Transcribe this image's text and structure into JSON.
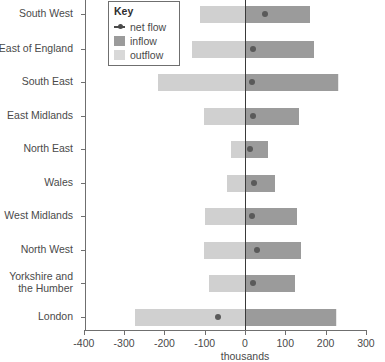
{
  "chart_data": {
    "type": "bar",
    "title": "",
    "subtitle": "",
    "xlabel": "thousands",
    "ylabel": "",
    "xlim": [
      -400,
      300
    ],
    "xticks": [
      -400,
      -300,
      -200,
      -100,
      0,
      100,
      200,
      300
    ],
    "xticklabels": [
      "-400",
      "-300",
      "-200",
      "-100",
      "0",
      "100",
      "200",
      "300"
    ],
    "grid": false,
    "orientation": "horizontal",
    "zero_reference_line": true,
    "units": "thousands",
    "categories": [
      "South West",
      "East of England",
      "South East",
      "East Midlands",
      "North East",
      "Wales",
      "West Midlands",
      "North West",
      "Yorkshire and the Humber",
      "London"
    ],
    "series": [
      {
        "name": "outflow",
        "color": "#d0d0d0",
        "values": [
          -112,
          -132,
          -217,
          -102,
          -35,
          -45,
          -99,
          -102,
          -89,
          -274
        ]
      },
      {
        "name": "inflow",
        "color": "#9b9b9b",
        "values": [
          161,
          171,
          233,
          134,
          57,
          74,
          129,
          139,
          124,
          228
        ]
      },
      {
        "name": "net flow",
        "color": "#5a5a5a",
        "values": [
          50,
          20,
          17,
          20,
          12,
          22,
          17,
          30,
          20,
          -67
        ]
      }
    ],
    "legend": {
      "position": "top-left",
      "title": "Key",
      "entries": [
        {
          "label": "net flow",
          "marker": "line-dot",
          "color": "#4a4a4a"
        },
        {
          "label": "inflow",
          "marker": "square",
          "color": "#9b9b9b"
        },
        {
          "label": "outflow",
          "marker": "square",
          "color": "#d8d8d8"
        }
      ]
    }
  }
}
